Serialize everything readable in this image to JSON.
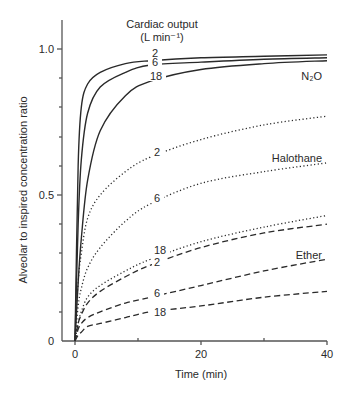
{
  "chart_data": {
    "type": "line",
    "title": "Cardiac output",
    "title_unit": "(L min⁻¹)",
    "xlabel": "Time (min)",
    "ylabel": "Alveolar to inspired concentration ratio",
    "xlim": [
      0,
      40
    ],
    "ylim": [
      0,
      1.0
    ],
    "x_ticks": [
      "0",
      "20",
      "40"
    ],
    "y_ticks": [
      "0",
      "0.5",
      "1.0"
    ],
    "grid": false,
    "x": [
      0,
      0.5,
      1,
      2,
      4,
      8,
      12,
      20,
      30,
      40
    ],
    "series": [
      {
        "group": "N2O",
        "name": "2",
        "style": "solid",
        "values": [
          0,
          0.6,
          0.8,
          0.88,
          0.92,
          0.95,
          0.96,
          0.97,
          0.975,
          0.98
        ]
      },
      {
        "group": "N2O",
        "name": "6",
        "style": "solid",
        "values": [
          0,
          0.4,
          0.62,
          0.78,
          0.87,
          0.92,
          0.945,
          0.955,
          0.965,
          0.97
        ]
      },
      {
        "group": "N2O",
        "name": "18",
        "style": "solid",
        "values": [
          0,
          0.2,
          0.35,
          0.55,
          0.72,
          0.84,
          0.89,
          0.93,
          0.95,
          0.96
        ]
      },
      {
        "group": "Halothane",
        "name": "2",
        "style": "dotted",
        "values": [
          0,
          0.2,
          0.3,
          0.42,
          0.5,
          0.58,
          0.63,
          0.69,
          0.74,
          0.77
        ]
      },
      {
        "group": "Halothane",
        "name": "6",
        "style": "dotted",
        "values": [
          0,
          0.12,
          0.18,
          0.25,
          0.32,
          0.41,
          0.47,
          0.54,
          0.58,
          0.61
        ]
      },
      {
        "group": "Halothane",
        "name": "18",
        "style": "dotted",
        "values": [
          0,
          0.06,
          0.1,
          0.15,
          0.19,
          0.24,
          0.28,
          0.34,
          0.39,
          0.43
        ]
      },
      {
        "group": "Ether",
        "name": "2",
        "style": "dashed",
        "values": [
          0,
          0.06,
          0.09,
          0.13,
          0.17,
          0.22,
          0.26,
          0.32,
          0.37,
          0.4
        ]
      },
      {
        "group": "Ether",
        "name": "6",
        "style": "dashed",
        "values": [
          0,
          0.04,
          0.06,
          0.08,
          0.1,
          0.13,
          0.15,
          0.19,
          0.24,
          0.28
        ]
      },
      {
        "group": "Ether",
        "name": "18",
        "style": "dashed",
        "values": [
          0,
          0.02,
          0.03,
          0.05,
          0.06,
          0.08,
          0.1,
          0.12,
          0.15,
          0.17
        ]
      }
    ],
    "annotations": {
      "n2o_label": "N₂O",
      "halothane_label": "Halothane",
      "ether_label": "Ether",
      "curve_labels": {
        "n2o_2": "2",
        "n2o_6": "6",
        "n2o_18": "18",
        "hal_2": "2",
        "hal_6": "6",
        "hal_18": "18",
        "eth_2": "2",
        "eth_6": "6",
        "eth_18": "18"
      }
    },
    "colors": {
      "line": "#2a2a2a",
      "background": "#ffffff"
    }
  }
}
